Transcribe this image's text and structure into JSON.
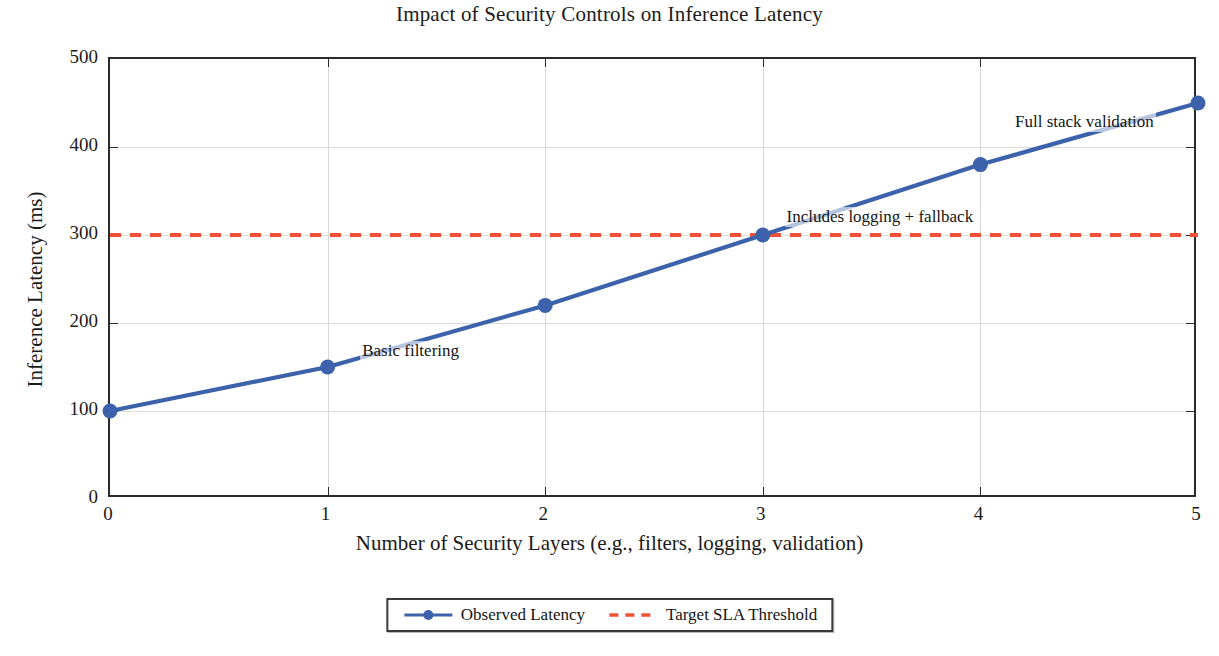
{
  "chart_data": {
    "type": "line",
    "title": "Impact of Security Controls on Inference Latency",
    "xlabel": "Number of Security Layers (e.g., filters, logging, validation)",
    "ylabel": "Inference Latency (ms)",
    "xlim": [
      0,
      5
    ],
    "ylim": [
      0,
      500
    ],
    "grid": true,
    "legend_position": "below-axes-center",
    "x": [
      0,
      1,
      2,
      3,
      4,
      5
    ],
    "xticks": [
      "0",
      "1",
      "2",
      "3",
      "4",
      "5"
    ],
    "yticks": [
      "0",
      "100",
      "200",
      "300",
      "400",
      "500"
    ],
    "ytick_values": [
      0,
      100,
      200,
      300,
      400,
      500
    ],
    "series": [
      {
        "name": "Observed Latency",
        "type": "line",
        "style": "solid",
        "marker": "circle",
        "color": "#3b62ab",
        "values": [
          100,
          150,
          220,
          300,
          380,
          450
        ]
      },
      {
        "name": "Target SLA Threshold",
        "type": "hline",
        "style": "dashed",
        "marker": "none",
        "color": "#ef5136",
        "value": 300
      }
    ],
    "annotations": [
      {
        "text": "Basic filtering",
        "x": 1.15,
        "y": 168
      },
      {
        "text": "Includes logging + fallback",
        "x": 3.1,
        "y": 320
      },
      {
        "text": "Full stack validation",
        "x": 4.15,
        "y": 428
      }
    ]
  },
  "legend": {
    "items": [
      {
        "label": "Observed Latency"
      },
      {
        "label": "Target SLA Threshold"
      }
    ]
  }
}
